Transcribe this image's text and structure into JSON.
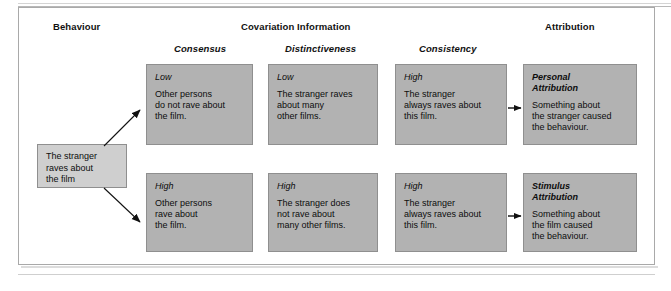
{
  "diagram": {
    "headers": {
      "behaviour": "Behaviour",
      "covariation": "Covariation Information",
      "attribution": "Attribution",
      "consensus": "Consensus",
      "distinctiveness": "Distinctiveness",
      "consistency": "Consistency"
    },
    "behaviour_box": {
      "text": "The stranger\nraves about\nthe film"
    },
    "rows": [
      {
        "name": "personal-attribution-row",
        "consensus": {
          "level": "Low",
          "text": "Other persons\ndo not rave about\nthe film."
        },
        "distinctiveness": {
          "level": "Low",
          "text": "The stranger raves\nabout many\nother films."
        },
        "consistency": {
          "level": "High",
          "text": "The stranger\nalways raves about\nthis film."
        },
        "attribution": {
          "level": "Personal\nAttribution",
          "text": "Something about\nthe stranger caused\nthe behaviour."
        }
      },
      {
        "name": "stimulus-attribution-row",
        "consensus": {
          "level": "High",
          "text": "Other persons\nrave about\nthe film."
        },
        "distinctiveness": {
          "level": "High",
          "text": "The stranger does\nnot rave about\nmany other films."
        },
        "consistency": {
          "level": "High",
          "text": "The stranger\nalways raves about\nthis film."
        },
        "attribution": {
          "level": "Stimulus\nAttribution",
          "text": "Something about\nthe film caused\nthe behaviour."
        }
      }
    ],
    "colors": {
      "cell_fill": "#b2b2b2",
      "behaviour_fill": "#cfcfcf",
      "border": "#8f8f8f",
      "shadow": "#cfcfcf",
      "text": "#0d0d0d"
    }
  }
}
